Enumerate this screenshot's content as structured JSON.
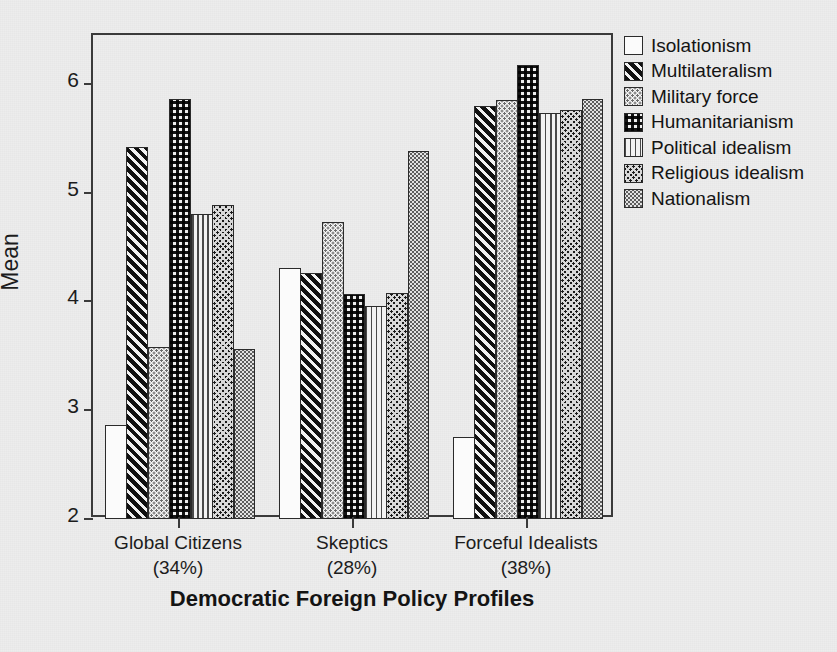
{
  "chart_data": {
    "type": "bar",
    "title": "",
    "xlabel": "Democratic Foreign Policy Profiles",
    "ylabel": "Mean",
    "ylim": [
      2,
      6.45
    ],
    "yticks": [
      2,
      3,
      4,
      5,
      6
    ],
    "ytick_labels": [
      "2",
      "3",
      "4",
      "5",
      "6"
    ],
    "grid": false,
    "legend_position": "right",
    "categories": [
      "Global Citizens\n(34%)",
      "Skeptics\n(28%)",
      "Forceful Idealists\n(38%)"
    ],
    "category_lines": [
      [
        "Global Citizens",
        "(34%)"
      ],
      [
        "Skeptics",
        "(28%)"
      ],
      [
        "Forceful Idealists",
        "(38%)"
      ]
    ],
    "series": [
      {
        "name": "Isolationism",
        "pattern": "solid-white",
        "values": [
          2.86,
          4.31,
          2.75
        ]
      },
      {
        "name": "Multilateralism",
        "pattern": "diag-dark",
        "values": [
          5.42,
          4.26,
          5.8
        ]
      },
      {
        "name": "Military force",
        "pattern": "dots-light",
        "values": [
          3.58,
          4.73,
          5.85
        ]
      },
      {
        "name": "Humanitarianism",
        "pattern": "check-med",
        "values": [
          5.86,
          4.07,
          6.17
        ]
      },
      {
        "name": "Political idealism",
        "pattern": "vert-lines",
        "values": [
          4.8,
          3.96,
          5.73
        ]
      },
      {
        "name": "Religious idealism",
        "pattern": "crosshatch-dark",
        "values": [
          4.89,
          4.08,
          5.76
        ]
      },
      {
        "name": "Nationalism",
        "pattern": "fine-dots",
        "values": [
          3.56,
          5.38,
          5.86
        ]
      }
    ]
  },
  "axis": {
    "y_title": "Mean",
    "x_title": "Democratic Foreign Policy Profiles"
  },
  "legend": {
    "items": [
      {
        "label": "Isolationism"
      },
      {
        "label": "Multilateralism"
      },
      {
        "label": "Military force"
      },
      {
        "label": "Humanitarianism"
      },
      {
        "label": "Political idealism"
      },
      {
        "label": "Religious idealism"
      },
      {
        "label": "Nationalism"
      }
    ]
  },
  "colors": {
    "axis": "#3a3a3a",
    "text": "#141414",
    "background": "#ededed",
    "bar_border": "#2b2b2b"
  }
}
